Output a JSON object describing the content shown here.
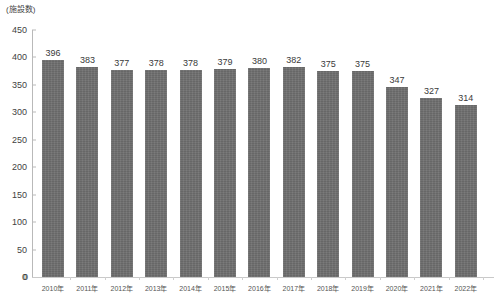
{
  "chart_data": {
    "type": "bar",
    "title": "",
    "subtitle": "",
    "unit_caption": "(施設数)",
    "xlabel": "",
    "ylabel": "",
    "categories": [
      "2010年",
      "2011年",
      "2012年",
      "2013年",
      "2014年",
      "2015年",
      "2016年",
      "2017年",
      "2018年",
      "2019年",
      "2020年",
      "2021年",
      "2022年"
    ],
    "values": [
      396,
      383,
      377,
      378,
      378,
      379,
      380,
      382,
      375,
      375,
      347,
      327,
      314
    ],
    "ylim": [
      0,
      450
    ],
    "ytick_step": 50,
    "yticks": [
      0,
      50,
      100,
      150,
      200,
      250,
      300,
      350,
      400,
      450
    ],
    "ytick_labels": [
      "0",
      "50",
      "100",
      "150",
      "200",
      "250",
      "300",
      "350",
      "400",
      "450"
    ],
    "grid": false,
    "legend": null,
    "legend_position": "none",
    "data_labels": true,
    "bar_color": "#6e6e6e",
    "axis_color": "#b9b9b9",
    "text_color": "#3f3f3f"
  }
}
